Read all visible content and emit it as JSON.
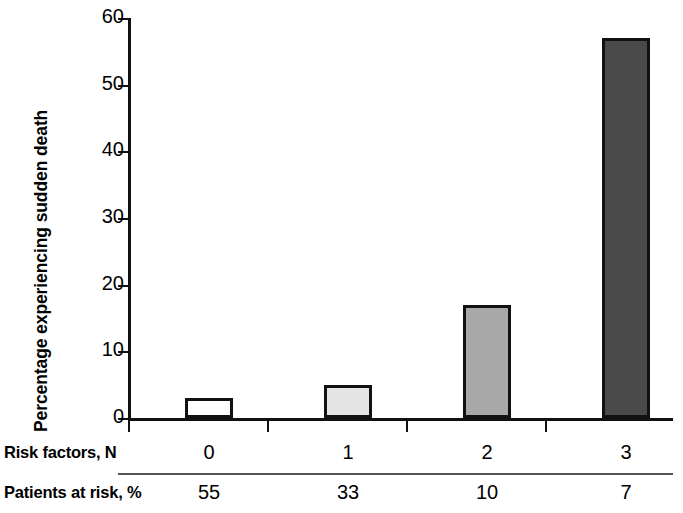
{
  "chart_data": {
    "type": "bar",
    "title": "",
    "subtitle": "",
    "xlabel": "Risk factors, N",
    "ylabel": "Percentage experiencing sudden death",
    "categories": [
      "0",
      "1",
      "2",
      "3"
    ],
    "values": [
      3,
      5,
      17,
      57
    ],
    "ylim": [
      0,
      60
    ],
    "yticks": [
      0,
      10,
      20,
      30,
      40,
      50,
      60
    ],
    "ytick_labels": [
      "0",
      "10",
      "20",
      "30",
      "40",
      "50",
      "60"
    ],
    "grid": false,
    "legend": false,
    "legend_position": "none",
    "bar_colors": [
      "#fdfdfd",
      "#e4e4e4",
      "#a8a8a8",
      "#4a4a4a"
    ],
    "bar_edge_color": "#111111",
    "annotations": []
  },
  "axis": {
    "y_title": "Percentage experiencing sudden death",
    "y_ticks": [
      {
        "value": 60,
        "label": "60"
      },
      {
        "value": 50,
        "label": "50"
      },
      {
        "value": 40,
        "label": "40"
      },
      {
        "value": 30,
        "label": "30"
      },
      {
        "value": 20,
        "label": "20"
      },
      {
        "value": 10,
        "label": "10"
      },
      {
        "value": 0,
        "label": "0"
      }
    ]
  },
  "table": {
    "rows": [
      {
        "label": "Risk factors, N",
        "cells": [
          "0",
          "1",
          "2",
          "3"
        ]
      },
      {
        "label": "Patients at risk, %",
        "cells": [
          "55",
          "33",
          "10",
          "7"
        ]
      }
    ]
  }
}
